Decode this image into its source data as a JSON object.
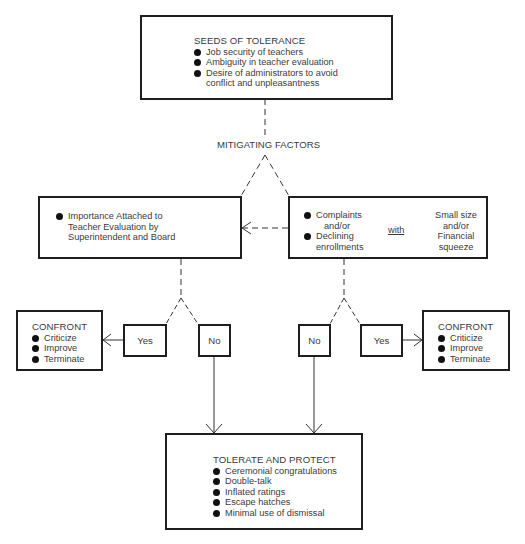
{
  "seeds": {
    "title": "SEEDS OF TOLERANCE",
    "items": [
      "Job security of teachers",
      "Ambiguity in teacher evaluation",
      "Desire of administrators to avoid"
    ],
    "item3_cont": "conflict and unpleasantness"
  },
  "mitigating_label": "MITIGATING FACTORS",
  "importance": {
    "line1": "Importance Attached to",
    "line2": "Teacher Evaluation by",
    "line3": "Superintendent and Board"
  },
  "complaints": {
    "item1": "Complaints",
    "andor1": "and/or",
    "item2": "Declining",
    "item2_cont": "enrollments",
    "with": "with",
    "right_lines": [
      "Small size",
      "and/or",
      "Financial",
      "squeeze"
    ]
  },
  "left_branch": {
    "yes": "Yes",
    "no": "No"
  },
  "right_branch": {
    "no": "No",
    "yes": "Yes"
  },
  "confront_left": {
    "title": "CONFRONT",
    "items": [
      "Criticize",
      "Improve",
      "Terminate"
    ]
  },
  "confront_right": {
    "title": "CONFRONT",
    "items": [
      "Criticize",
      "Improve",
      "Terminate"
    ]
  },
  "tolerate": {
    "title": "TOLERATE AND PROTECT",
    "items": [
      "Ceremonial congratulations",
      "Double-talk",
      "Inflated ratings",
      "Escape hatches",
      "Minimal use of dismissal"
    ]
  }
}
